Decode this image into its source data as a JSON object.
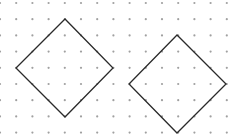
{
  "diagram": {
    "title": "",
    "background": "#ffffff",
    "grid": {
      "type": "dot-grid",
      "spacing": 16.2,
      "origin_x": 0,
      "origin_y": 3,
      "cols": 15,
      "rows": 9,
      "dot_color": "#a0a0a0",
      "dot_radius": 1.1
    },
    "shapes": [
      {
        "name": "left-square-rotated",
        "type": "polygon",
        "points": [
          [
            65,
            19
          ],
          [
            16,
            68
          ],
          [
            65,
            117
          ],
          [
            113,
            68
          ]
        ],
        "stroke": "#2a2a2a",
        "stroke_width": 1.3
      },
      {
        "name": "right-square-rotated",
        "type": "polygon",
        "points": [
          [
            177,
            35
          ],
          [
            129,
            84
          ],
          [
            177,
            133
          ],
          [
            226,
            84
          ]
        ],
        "stroke": "#2a2a2a",
        "stroke_width": 1.3
      }
    ]
  }
}
